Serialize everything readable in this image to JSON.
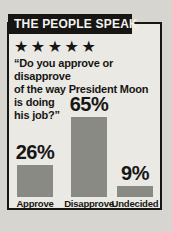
{
  "panel": {
    "header": "THE PEOPLE SPEAK",
    "rating_stars": "★★★★★",
    "question_lines": [
      "“Do you approve or disapprove",
      "of the way President Moon",
      "is doing",
      "his job?”"
    ]
  },
  "chart_data": {
    "type": "bar",
    "title": "THE PEOPLE SPEAK",
    "subtitle": "“Do you approve or disapprove of the way President Moon is doing his job?”",
    "categories": [
      "Approve",
      "Disapprove",
      "Undecided"
    ],
    "values": [
      26,
      65,
      9
    ],
    "value_labels": [
      "26%",
      "65%",
      "9%"
    ],
    "unit": "%",
    "ylim": [
      0,
      65
    ],
    "grid": false,
    "legend": false,
    "bar_color": "#8a8a85",
    "panel_background": "#eae9e4",
    "page_background": "#d6d5d0",
    "ink_color": "#171615"
  }
}
